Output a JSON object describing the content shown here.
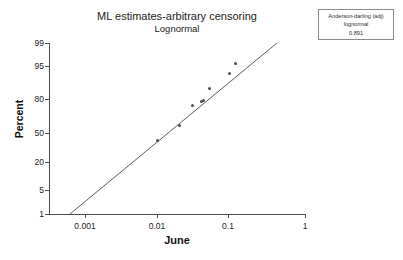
{
  "title": {
    "main": "ML estimates-arbitrary censoring",
    "sub": "Lognormal"
  },
  "gof": {
    "line1": "Anderson-darling (adj)",
    "line2": "lognormal",
    "line3": "0.891"
  },
  "axes": {
    "ylabel": "Percent",
    "xlabel": "June"
  },
  "colors": {
    "axis": "#4d4d4d",
    "marker": "#4a4a58",
    "fit_line": "#5a5a66",
    "box_border": "#8a8a8a",
    "background": "#ffffff"
  },
  "chart_data": {
    "type": "scatter",
    "title": "ML estimates-arbitrary censoring",
    "subtitle": "Lognormal",
    "xlabel": "June",
    "ylabel": "Percent",
    "xscale": "log",
    "yscale": "probability-lognormal",
    "grid": false,
    "legend_position": "top-right",
    "xlim": [
      0.0005,
      1
    ],
    "ylim": [
      1,
      99
    ],
    "xticks": [
      0.001,
      0.01,
      0.1,
      1
    ],
    "xticklabels": [
      "0.001",
      "0.01",
      "0.1",
      "1"
    ],
    "yticks": [
      1,
      5,
      20,
      50,
      80,
      95,
      99
    ],
    "yticklabels": [
      "1",
      "5",
      "20",
      "50",
      "80",
      "95",
      "99"
    ],
    "series": [
      {
        "name": "probability-plot-points",
        "type": "scatter",
        "x": [
          0.01,
          0.02,
          0.03,
          0.04,
          0.0415,
          0.05,
          0.09,
          0.11
        ],
        "y": [
          40.0,
          53.0,
          72.0,
          76.0,
          77.0,
          86.0,
          91.0,
          96.0
        ]
      },
      {
        "name": "ml-fit-line",
        "type": "line",
        "x": [
          0.00065,
          0.4
        ],
        "y": [
          1.0,
          99.0
        ]
      }
    ],
    "annotations": [
      {
        "kind": "goodness-of-fit-box",
        "lines": [
          "Anderson-darling (adj)",
          "lognormal",
          "0.891"
        ]
      }
    ]
  },
  "ytick_items": [
    {
      "label": "99",
      "top": 39
    },
    {
      "label": "95",
      "top": 62
    },
    {
      "label": "80",
      "top": 95
    },
    {
      "label": "50",
      "top": 129
    },
    {
      "label": "20",
      "top": 158
    },
    {
      "label": "5",
      "top": 186
    },
    {
      "label": "1",
      "top": 210
    }
  ],
  "ytick_marks": [
    43,
    66,
    99,
    133,
    162,
    190,
    214
  ],
  "xtick_items": [
    {
      "label": "0.001",
      "left": 85
    },
    {
      "label": "0.01",
      "left": 157
    },
    {
      "label": "0.1",
      "left": 228
    },
    {
      "label": "1",
      "left": 305
    }
  ],
  "point_px": [
    {
      "left": 157,
      "top": 140
    },
    {
      "left": 179,
      "top": 125
    },
    {
      "left": 192,
      "top": 105
    },
    {
      "left": 201,
      "top": 101
    },
    {
      "left": 203,
      "top": 100
    },
    {
      "left": 209,
      "top": 88
    },
    {
      "left": 229,
      "top": 73
    },
    {
      "left": 235,
      "top": 63
    }
  ],
  "fit_line_px": {
    "x1": 70,
    "y1": 214,
    "x2": 277,
    "y2": 43
  }
}
